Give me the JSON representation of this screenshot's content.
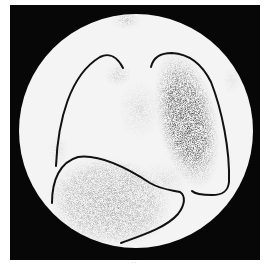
{
  "figure": {
    "colors": {
      "frame": "#070707",
      "field": "#f4f4f4",
      "uptake_dark": "#151515",
      "contour": "#111111"
    },
    "regions": [
      {
        "name": "right-lung-contour",
        "intensity": "low"
      },
      {
        "name": "left-lung-contour",
        "intensity": "high"
      },
      {
        "name": "liver-contour",
        "intensity": "medium"
      }
    ],
    "caption": "· ·"
  }
}
